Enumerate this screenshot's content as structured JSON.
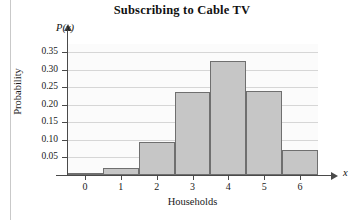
{
  "chart_data": {
    "type": "bar",
    "title": "Subscribing to Cable TV",
    "xlabel": "Households",
    "ylabel": "Probability",
    "x_axis_symbol": "x",
    "y_axis_symbol": "P(x)",
    "categories": [
      "0",
      "1",
      "2",
      "3",
      "4",
      "5",
      "6"
    ],
    "values": [
      0.005,
      0.02,
      0.095,
      0.235,
      0.325,
      0.24,
      0.072
    ],
    "xlim": [
      -0.5,
      6.5
    ],
    "ylim": [
      0,
      0.375
    ],
    "ytick_labels": [
      "0.35",
      "0.30",
      "0.25",
      "0.20",
      "0.15",
      "0.10",
      "0.05"
    ],
    "ytick_values": [
      0.35,
      0.3,
      0.25,
      0.2,
      0.15,
      0.1,
      0.05
    ],
    "grid": true,
    "legend": "none",
    "bar_fill_color": "#c6c6c6",
    "bar_edge_color": "#6f6f6f",
    "gridline_color": "#d6d6d6",
    "axis_color": "#4a4a4a",
    "plot_background": "#fbfbfb"
  }
}
